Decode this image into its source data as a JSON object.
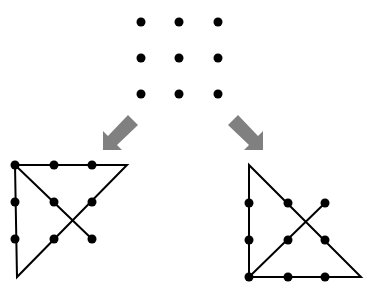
{
  "diagram": {
    "colors": {
      "dot": "#000000",
      "line": "#000000",
      "arrow": "#808080",
      "background": "#ffffff"
    },
    "puzzle": {
      "rows": 3,
      "cols": 3
    },
    "solutions": [
      {
        "name": "solution-left",
        "path_description": "four straight lines through all nine dots, extending beyond the grid"
      },
      {
        "name": "solution-right",
        "path_description": "four straight lines through all nine dots, extending beyond the grid"
      }
    ],
    "arrows": [
      {
        "name": "arrow-down-left",
        "direction": "down-left"
      },
      {
        "name": "arrow-down-right",
        "direction": "down-right"
      }
    ]
  }
}
